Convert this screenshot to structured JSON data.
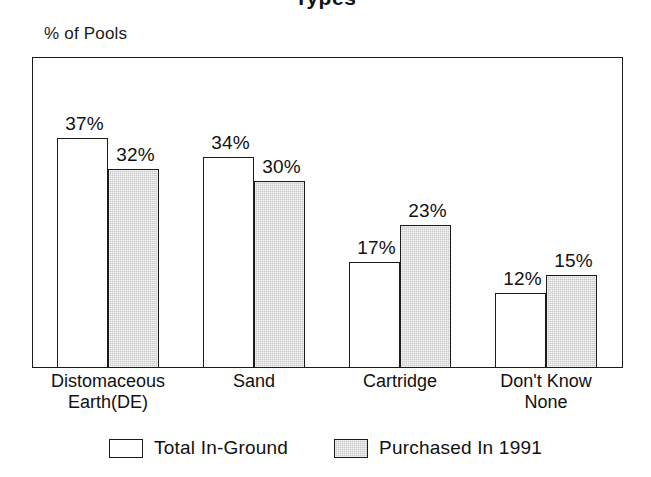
{
  "figure": {
    "title_fragment": "Types",
    "ylabel": "% of Pools"
  },
  "chart_data": {
    "type": "bar",
    "title": "Types",
    "xlabel": "",
    "ylabel": "% of Pools",
    "ylim": [
      0,
      50
    ],
    "grid": false,
    "legend_position": "bottom",
    "value_suffix": "%",
    "categories": [
      "Distomaceous Earth(DE)",
      "Sand",
      "Cartridge",
      "Don't Know None"
    ],
    "category_lines": [
      [
        "Distomaceous",
        "Earth(DE)"
      ],
      [
        "Sand",
        ""
      ],
      [
        "Cartridge",
        ""
      ],
      [
        "Don't Know",
        "None"
      ]
    ],
    "series": [
      {
        "name": "Total In-Ground",
        "color": "#ffffff",
        "values": [
          37,
          34,
          17,
          12
        ],
        "labels": [
          "37%",
          "34%",
          "17%",
          "12%"
        ]
      },
      {
        "name": "Purchased In 1991",
        "color": "#c9c9c9",
        "values": [
          32,
          30,
          23,
          15
        ],
        "labels": [
          "32%",
          "30%",
          "23%",
          "15%"
        ]
      }
    ]
  },
  "legend": [
    {
      "label": "Total In-Ground",
      "swatch": "white-swatch"
    },
    {
      "label": "Purchased In 1991",
      "swatch": "gray-swatch"
    }
  ]
}
